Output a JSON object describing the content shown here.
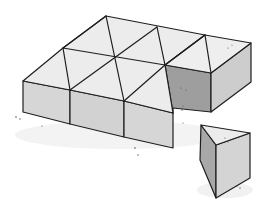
{
  "image": {
    "description": "Hand-drawn illustration of a rectangular cake cut into triangular pieces, with one triangular piece removed and sitting to the right",
    "colors": {
      "background": "#ffffff",
      "top_face": "#ececec",
      "front_face": "#d4d4d4",
      "side_face": "#c9c9c9",
      "shadow_face": "#9a9a9a",
      "outline": "#1e1e1e",
      "ground_shadow": "#f1f1f1"
    },
    "pieces": {
      "grid_rows": 2,
      "triangles_remaining": 11,
      "triangles_removed": 1
    }
  }
}
